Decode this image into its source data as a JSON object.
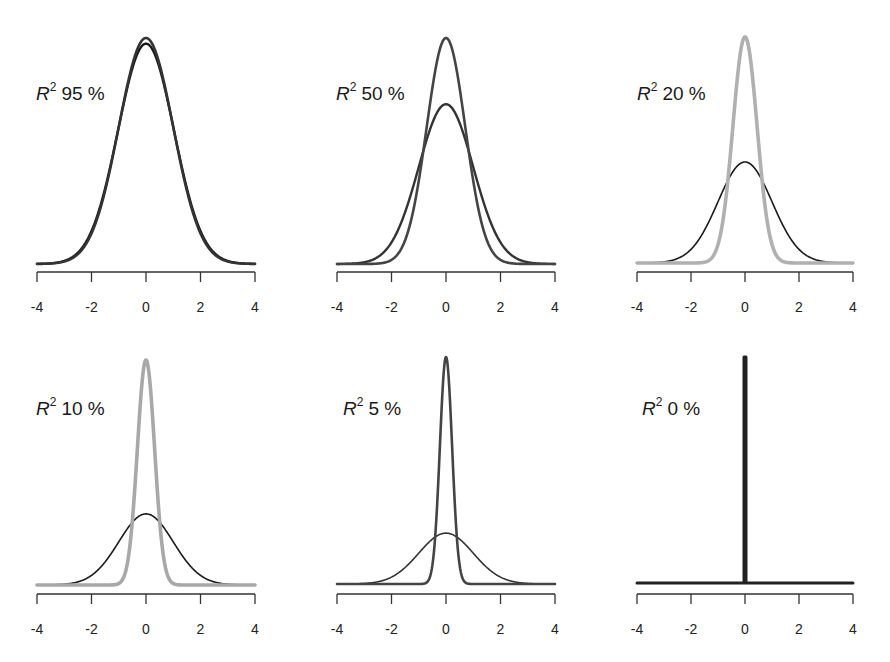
{
  "chart_data": [
    {
      "type": "line",
      "title": "R² 95 %",
      "label_prefix": "R",
      "label_sup": "2",
      "label_value": "95 %",
      "xlabel": "",
      "ylabel": "",
      "xlim": [
        -4,
        4
      ],
      "xticks": [
        "-4",
        "-2",
        "0",
        "2",
        "4"
      ],
      "grid": false,
      "series": [
        {
          "name": "sharp-density",
          "color": "#333333",
          "sd": 1.0,
          "peak_rel": 1.0
        },
        {
          "name": "wide-density",
          "color": "#1a1a1a",
          "sd": 1.026,
          "peak_rel": 0.975
        }
      ]
    },
    {
      "type": "line",
      "title": "R² 50 %",
      "label_prefix": "R",
      "label_sup": "2",
      "label_value": "50 %",
      "xlabel": "",
      "ylabel": "",
      "xlim": [
        -4,
        4
      ],
      "xticks": [
        "-4",
        "-2",
        "0",
        "2",
        "4"
      ],
      "grid": false,
      "series": [
        {
          "name": "sharp-density",
          "color": "#444444",
          "sd": 0.707,
          "peak_rel": 1.0
        },
        {
          "name": "wide-density",
          "color": "#333333",
          "sd": 1.0,
          "peak_rel": 0.707
        }
      ]
    },
    {
      "type": "line",
      "title": "R² 20 %",
      "label_prefix": "R",
      "label_sup": "2",
      "label_value": "20 %",
      "xlabel": "",
      "ylabel": "",
      "xlim": [
        -4,
        4
      ],
      "xticks": [
        "-4",
        "-2",
        "0",
        "2",
        "4"
      ],
      "grid": false,
      "series": [
        {
          "name": "sharp-density",
          "color": "#b0b0b0",
          "sd": 0.447,
          "peak_rel": 1.0
        },
        {
          "name": "wide-density",
          "color": "#1a1a1a",
          "sd": 1.0,
          "peak_rel": 0.447
        }
      ]
    },
    {
      "type": "line",
      "title": "R² 10 %",
      "label_prefix": "R",
      "label_sup": "2",
      "label_value": "10 %",
      "xlabel": "",
      "ylabel": "",
      "xlim": [
        -4,
        4
      ],
      "xticks": [
        "-4",
        "-2",
        "0",
        "2",
        "4"
      ],
      "grid": false,
      "series": [
        {
          "name": "sharp-density",
          "color": "#a8a8a8",
          "sd": 0.316,
          "peak_rel": 1.0
        },
        {
          "name": "wide-density",
          "color": "#1a1a1a",
          "sd": 1.0,
          "peak_rel": 0.316
        }
      ]
    },
    {
      "type": "line",
      "title": "R² 5 %",
      "label_prefix": "R",
      "label_sup": "2",
      "label_value": "5 %",
      "xlabel": "",
      "ylabel": "",
      "xlim": [
        -4,
        4
      ],
      "xticks": [
        "-4",
        "-2",
        "0",
        "2",
        "4"
      ],
      "grid": false,
      "series": [
        {
          "name": "sharp-density",
          "color": "#444444",
          "sd": 0.224,
          "peak_rel": 1.0
        },
        {
          "name": "wide-density",
          "color": "#333333",
          "sd": 1.0,
          "peak_rel": 0.224
        }
      ]
    },
    {
      "type": "line",
      "title": "R² 0 %",
      "label_prefix": "R",
      "label_sup": "2",
      "label_value": "0 %",
      "xlabel": "",
      "ylabel": "",
      "xlim": [
        -4,
        4
      ],
      "xticks": [
        "-4",
        "-2",
        "0",
        "2",
        "4"
      ],
      "grid": false,
      "series": [
        {
          "name": "sharp-density",
          "color": "#222222",
          "sd": 0.0,
          "peak_rel": 1.0
        },
        {
          "name": "wide-density",
          "color": "#222222",
          "sd": 1.0,
          "peak_rel": 0.0
        }
      ]
    }
  ],
  "layout": {
    "panels": [
      {
        "x0": 37,
        "x1": 255,
        "baseline": 264,
        "peak": 38,
        "axis_y": 272,
        "label_x": 36,
        "label_y": 100
      },
      {
        "x0": 337,
        "x1": 555,
        "baseline": 264,
        "peak": 38,
        "axis_y": 272,
        "label_x": 336,
        "label_y": 100
      },
      {
        "x0": 637,
        "x1": 853,
        "baseline": 263,
        "peak": 37,
        "axis_y": 272,
        "label_x": 637,
        "label_y": 100
      },
      {
        "x0": 37,
        "x1": 255,
        "baseline": 585,
        "peak": 360,
        "axis_y": 594,
        "label_x": 36,
        "label_y": 415
      },
      {
        "x0": 337,
        "x1": 555,
        "baseline": 584,
        "peak": 357,
        "axis_y": 594,
        "label_x": 343,
        "label_y": 415
      },
      {
        "x0": 637,
        "x1": 853,
        "baseline": 583,
        "peak": 357,
        "axis_y": 594,
        "label_x": 642,
        "label_y": 415
      }
    ]
  }
}
